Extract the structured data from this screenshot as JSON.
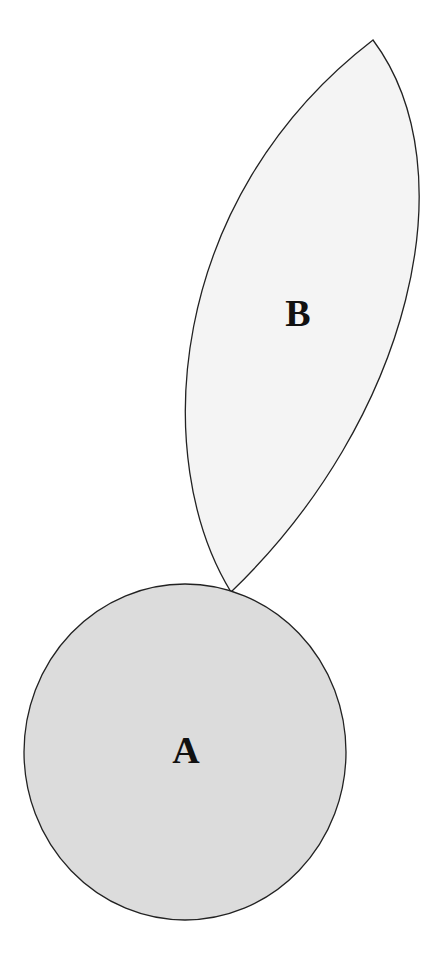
{
  "diagram": {
    "shapes": [
      {
        "id": "A",
        "label": "A",
        "kind": "circle",
        "fill": "#dcdcdc",
        "stroke": "#222222"
      },
      {
        "id": "B",
        "label": "B",
        "kind": "lens",
        "fill": "#f4f4f4",
        "stroke": "#222222"
      }
    ],
    "background": "#ffffff"
  }
}
